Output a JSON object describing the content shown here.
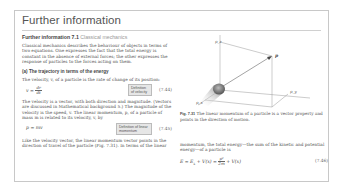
{
  "page": {
    "title": "Further information"
  },
  "section": {
    "label": "Further information 7.1",
    "subtitle": "Classical mechanics",
    "intro": "Classical mechanics describes the behaviour of objects in terms of two equations. One expresses the fact that the total energy is constant in the absence of external forces; the other expresses the response of particles to the forces acting on them.",
    "subheading": "(a)  The trajectory in terms of the energy",
    "velocity_sentence": "The velocity, v, of a particle is the rate of change of its position:"
  },
  "equations": [
    {
      "lhs": "v =",
      "num": "dr",
      "den": "dt",
      "box_label": "Definition of velocity",
      "number": "(7.44)"
    },
    {
      "expr": "p = mv",
      "box_label": "Definition of linear momentum",
      "number": "(7.45)"
    },
    {
      "expr_left": "E = E",
      "expr_sub": "k",
      "expr_mid": " + V(x) =",
      "num": "p²",
      "den": "2m",
      "expr_right": "+ V(x)",
      "number": "(7.46)"
    }
  ],
  "paragraphs": {
    "velocity_vector": "The velocity is a vector, with both direction and magnitude. (Vectors are discussed in Mathematical background 5.) The magnitude of the velocity is the speed, v. The linear momentum, p, of a particle of mass m is related to its velocity, v, by",
    "momentum_direction": "Like the velocity vector, the linear momentum vector points in the direction of travel of the particle (Fig. 7.31). In terms of the linear",
    "energy": "momentum, the total energy—the sum of the kinetic and potential energy—of a particle is"
  },
  "figure": {
    "labels": {
      "pz": "p_z",
      "p": "p",
      "px": "p_x",
      "py": "p_y"
    },
    "caption_label": "Fig. 7.31",
    "caption_text": "The linear momentum of a particle is a vector property and points in the direction of motion."
  },
  "colors": {
    "frame_border": "#c8c8c8",
    "definition_box": "#e6e6e6",
    "text": "#555555"
  }
}
